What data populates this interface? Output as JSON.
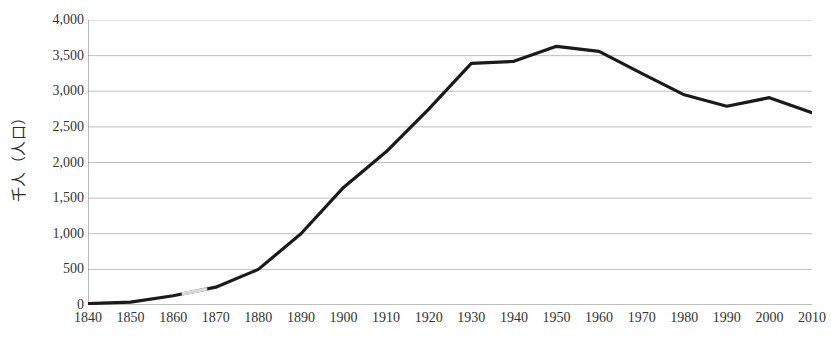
{
  "chart_data": {
    "type": "line",
    "title": "",
    "xlabel": "",
    "ylabel": "千人（人口）",
    "x": [
      1840,
      1850,
      1860,
      1870,
      1880,
      1890,
      1900,
      1910,
      1920,
      1930,
      1940,
      1950,
      1960,
      1970,
      1980,
      1990,
      2000,
      2010
    ],
    "xtick_labels": [
      "1840",
      "1850",
      "1860",
      "1870",
      "1880",
      "1890",
      "1900",
      "1910",
      "1920",
      "1930",
      "1940",
      "1950",
      "1960",
      "1970",
      "1980",
      "1990",
      "2000",
      "2010"
    ],
    "values": [
      20,
      40,
      130,
      250,
      500,
      1000,
      1650,
      2150,
      2750,
      3390,
      3420,
      3630,
      3560,
      3250,
      2950,
      2790,
      2910,
      2700
    ],
    "ytick_labels": [
      "4,000",
      "3,500",
      "3,000",
      "2,500",
      "2,000",
      "1,500",
      "1,000",
      "500",
      "0"
    ],
    "ytick_values": [
      4000,
      3500,
      3000,
      2500,
      2000,
      1500,
      1000,
      500,
      0
    ],
    "ylim": [
      0,
      4000
    ],
    "xlim": [
      1840,
      2010
    ],
    "grid": "horizontal",
    "legend": "none",
    "series_color": "#1a1a1a",
    "grid_color": "#bfbfbf",
    "axis_color": "#808080",
    "gap_segments": [
      [
        1862,
        1868
      ]
    ]
  }
}
